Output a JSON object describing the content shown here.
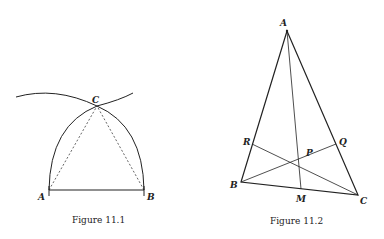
{
  "figures": [
    {
      "caption": "Figure 11.1",
      "points": {
        "A": "A",
        "B": "B",
        "C": "C"
      }
    },
    {
      "caption": "Figure 11.2",
      "points": {
        "A": "A",
        "B": "B",
        "C": "C",
        "R": "R",
        "Q": "Q",
        "P": "P",
        "M": "M"
      }
    }
  ]
}
